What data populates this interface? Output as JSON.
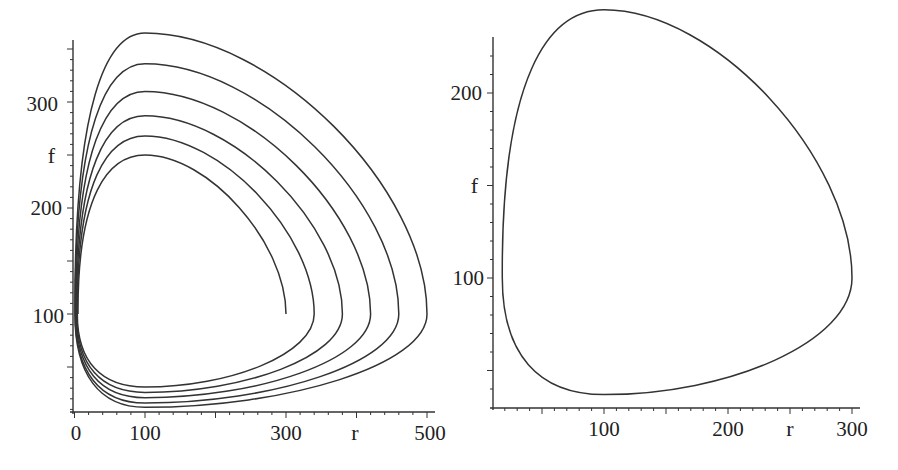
{
  "chart_data": [
    {
      "type": "line",
      "title": "",
      "xlabel": "r",
      "ylabel": "f",
      "xlim": [
        0,
        510
      ],
      "ylim": [
        8,
        370
      ],
      "x_ticks": [
        0,
        100,
        300,
        500
      ],
      "y_ticks": [
        100,
        200,
        300
      ],
      "grid": false,
      "legend": null,
      "description": "Phase portrait: trajectories spiraling outward in (r, f) plane",
      "series": [
        {
          "name": "trajectory-1",
          "peak": {
            "r": 100,
            "f": 250
          },
          "right_extreme": {
            "r": 300,
            "f": 100
          },
          "bottom": {
            "r": 100,
            "f": 37
          },
          "left": {
            "r": 5,
            "f": 100
          }
        },
        {
          "name": "trajectory-2",
          "peak": {
            "r": 100,
            "f": 268
          },
          "right_extreme": {
            "r": 340,
            "f": 100
          },
          "bottom": {
            "r": 100,
            "f": 31
          },
          "left": {
            "r": 4,
            "f": 100
          }
        },
        {
          "name": "trajectory-3",
          "peak": {
            "r": 100,
            "f": 287
          },
          "right_extreme": {
            "r": 380,
            "f": 100
          },
          "bottom": {
            "r": 100,
            "f": 26
          },
          "left": {
            "r": 3,
            "f": 100
          }
        },
        {
          "name": "trajectory-4",
          "peak": {
            "r": 100,
            "f": 310
          },
          "right_extreme": {
            "r": 420,
            "f": 100
          },
          "bottom": {
            "r": 100,
            "f": 21
          },
          "left": {
            "r": 2,
            "f": 100
          }
        },
        {
          "name": "trajectory-5",
          "peak": {
            "r": 100,
            "f": 336
          },
          "right_extreme": {
            "r": 460,
            "f": 100
          },
          "bottom": {
            "r": 100,
            "f": 16
          },
          "left": {
            "r": 1,
            "f": 100
          }
        },
        {
          "name": "trajectory-6",
          "peak": {
            "r": 100,
            "f": 365
          },
          "right_extreme": {
            "r": 500,
            "f": 100
          },
          "bottom": {
            "r": 100,
            "f": 12
          },
          "left": {
            "r": 0.5,
            "f": 100
          }
        }
      ]
    },
    {
      "type": "line",
      "title": "",
      "xlabel": "r",
      "ylabel": "f",
      "xlim": [
        10,
        310
      ],
      "ylim": [
        30,
        260
      ],
      "x_ticks": [
        100,
        200,
        300
      ],
      "y_ticks": [
        100,
        200
      ],
      "grid": false,
      "legend": null,
      "description": "Closed periodic orbit (limit cycle) in (r, f) plane",
      "series": [
        {
          "name": "limit-cycle",
          "peak": {
            "r": 100,
            "f": 245
          },
          "right_extreme": {
            "r": 300,
            "f": 100
          },
          "bottom": {
            "r": 100,
            "f": 37
          },
          "left": {
            "r": 18,
            "f": 100
          }
        }
      ]
    }
  ],
  "left_plot": {
    "x_tick_labels": [
      "0",
      "100",
      "300",
      "500"
    ],
    "y_tick_labels": [
      "100",
      "200",
      "300"
    ],
    "x_axis_name": "r",
    "y_axis_name": "f"
  },
  "right_plot": {
    "x_tick_labels": [
      "100",
      "200",
      "300"
    ],
    "y_tick_labels": [
      "100",
      "200"
    ],
    "x_axis_name": "r",
    "y_axis_name": "f"
  }
}
